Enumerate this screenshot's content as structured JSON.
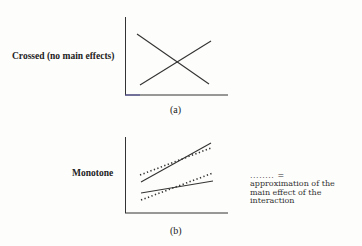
{
  "panel_a": {
    "row_label": "Crossed (no main effects)",
    "caption": "(a)"
  },
  "panel_b": {
    "row_label": "Monotone",
    "caption": "(b)"
  },
  "legend": {
    "symbol": "........ =",
    "lines": [
      "approximation of the",
      "main effect of the",
      "interaction"
    ]
  },
  "colors": {
    "ink": "#333333",
    "background": "#fdfdfb",
    "axis_accent": "#4a4a9a"
  }
}
